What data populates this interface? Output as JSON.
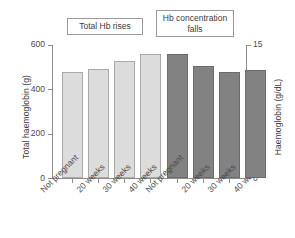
{
  "chart_data": {
    "type": "bar",
    "title": "",
    "subtitle": "",
    "grid": false,
    "legend_position": "none",
    "categories": [
      "Not pregnant",
      "20 weeks",
      "30 weeks",
      "40 weeks"
    ],
    "series": [
      {
        "name": "Total haemoglobin (g)",
        "axis": "left",
        "unit": "g",
        "color": "#dcdcdc",
        "border_color": "#a9a9a9",
        "values": [
          478,
          492,
          528,
          560
        ]
      },
      {
        "name": "Haemoglobin (g/dL)",
        "axis": "right",
        "unit": "g/dL",
        "color": "#828282",
        "border_color": "#6b6b6b",
        "values": [
          14.0,
          12.6,
          12.0,
          12.2
        ]
      }
    ],
    "xlabel": "",
    "ylabel": "Total haemoglobin (g)",
    "y2label": "Haemoglobin (g/dL)",
    "ylim": [
      0,
      600
    ],
    "y2lim": [
      0,
      15
    ],
    "yticks": [
      "0",
      "200",
      "400",
      "600"
    ],
    "y2ticks": [
      "0",
      "5",
      "10",
      "15"
    ],
    "annotations": [
      {
        "text": "Total Hb rises"
      },
      {
        "text": "Hb concentration falls"
      }
    ]
  },
  "axes": {
    "left_title": "Total haemoglobin (g)",
    "right_title": "Haemoglobin (g/dL)",
    "left_ticks": [
      "600",
      "400",
      "200",
      "0"
    ],
    "right_ticks": [
      "15",
      "10",
      "5",
      "0"
    ]
  },
  "groups": [
    {
      "id": "total-hb",
      "annotation": "Total Hb rises",
      "labels": [
        "Not pregnant",
        "20 weeks",
        "30 weeks",
        "40 weeks"
      ]
    },
    {
      "id": "hb-concentration",
      "annotation": "Hb concentration falls",
      "labels": [
        "Not pregnant",
        "20 weeks",
        "30 weeks",
        "40 weeks"
      ]
    }
  ],
  "annotation_boxes": {
    "total": "Total Hb rises",
    "concentration_line1": "Hb concentration",
    "concentration_line2": "falls"
  }
}
